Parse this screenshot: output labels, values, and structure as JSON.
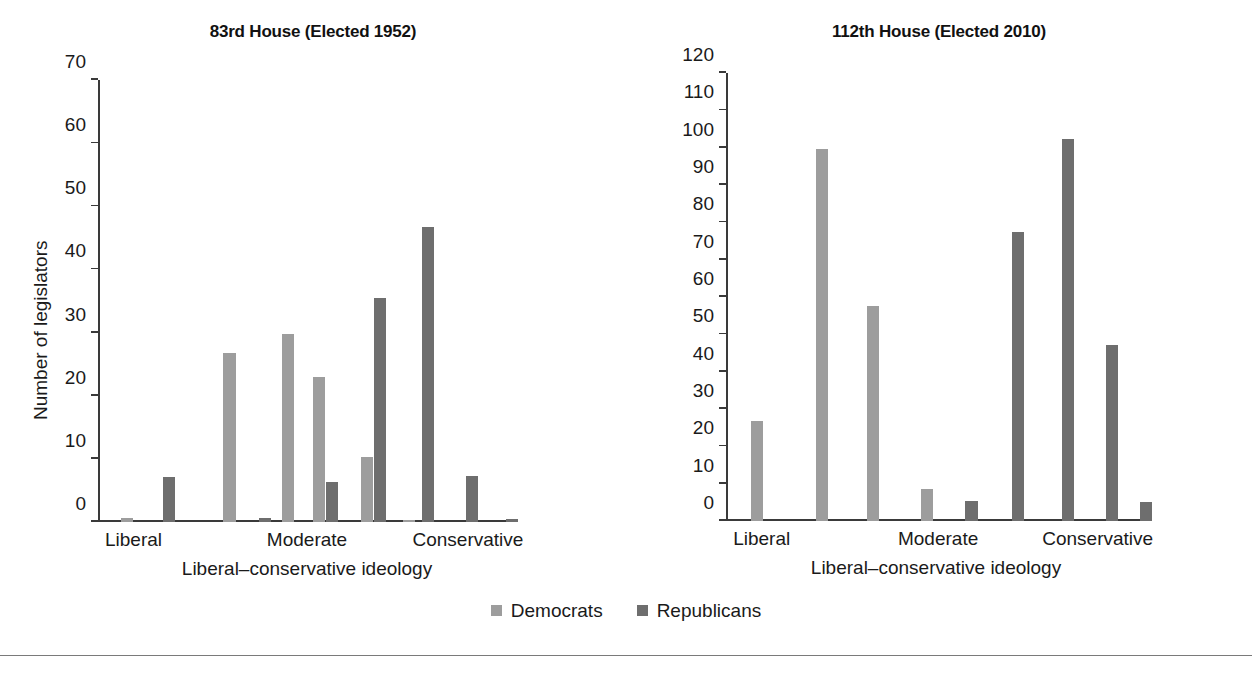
{
  "figure": {
    "legend": {
      "items": [
        {
          "label": "Democrats",
          "color": "#9d9d9d",
          "icon": "square-swatch-icon"
        },
        {
          "label": "Republicans",
          "color": "#6e6e6e",
          "icon": "square-swatch-icon"
        }
      ]
    },
    "colors": {
      "democrat": "#9d9d9d",
      "republican": "#6e6e6e",
      "axis": "#3a3a3a",
      "text": "#1a1a1a",
      "background": "#ffffff",
      "footer_rule": "#7a7a7a"
    }
  },
  "chart_data": [
    {
      "type": "bar",
      "id": "house-83rd",
      "title": "83rd House (Elected 1952)",
      "xlabel": "Liberal–conservative ideology",
      "ylabel": "Number of legislators",
      "ylim": [
        0,
        70
      ],
      "yticks": [
        0,
        10,
        20,
        30,
        40,
        50,
        60,
        70
      ],
      "grid": false,
      "legend_position": "bottom-center",
      "categories": [
        "Liberal",
        "Moderate",
        "Conservative"
      ],
      "category_positions": [
        0.085,
        0.5,
        0.885
      ],
      "bins": [
        {
          "position": 0.055,
          "series": "Democrats",
          "value": 0.7
        },
        {
          "position": 0.155,
          "series": "Republicans",
          "value": 7.2
        },
        {
          "position": 0.3,
          "series": "Democrats",
          "value": 26.8
        },
        {
          "position": 0.385,
          "series": "Republicans",
          "value": 0.6
        },
        {
          "position": 0.44,
          "series": "Democrats",
          "value": 29.8
        },
        {
          "position": 0.545,
          "series": "Republicans",
          "value": 6.4
        },
        {
          "position": 0.515,
          "series": "Democrats",
          "value": 23.0
        },
        {
          "position": 0.66,
          "series": "Republicans",
          "value": 35.5
        },
        {
          "position": 0.63,
          "series": "Democrats",
          "value": 10.3
        },
        {
          "position": 0.775,
          "series": "Republicans",
          "value": 46.8
        },
        {
          "position": 0.73,
          "series": "Democrats",
          "value": 0.2
        },
        {
          "position": 0.88,
          "series": "Republicans",
          "value": 7.3
        },
        {
          "position": 0.975,
          "series": "Republicans",
          "value": 0.4
        }
      ],
      "series": [
        {
          "name": "Democrats",
          "values": [
            0.7,
            26.8,
            29.8,
            23.0,
            10.3,
            0.2
          ]
        },
        {
          "name": "Republicans",
          "values": [
            7.2,
            0.6,
            6.4,
            35.5,
            46.8,
            7.3,
            0.4
          ]
        }
      ]
    },
    {
      "type": "bar",
      "id": "house-112th",
      "title": "112th House (Elected 2010)",
      "xlabel": "Liberal–conservative ideology",
      "ylabel": "Number of legislators",
      "ylim": [
        0,
        120
      ],
      "yticks": [
        0,
        10,
        20,
        30,
        40,
        50,
        60,
        70,
        80,
        90,
        100,
        110,
        120
      ],
      "grid": false,
      "legend_position": "bottom-center",
      "categories": [
        "Liberal",
        "Moderate",
        "Conservative"
      ],
      "category_positions": [
        0.085,
        0.505,
        0.885
      ],
      "bins": [
        {
          "position": 0.06,
          "series": "Democrats",
          "value": 26.8
        },
        {
          "position": 0.215,
          "series": "Democrats",
          "value": 99.7
        },
        {
          "position": 0.335,
          "series": "Democrats",
          "value": 57.5
        },
        {
          "position": 0.465,
          "series": "Democrats",
          "value": 8.5
        },
        {
          "position": 0.57,
          "series": "Republicans",
          "value": 5.4
        },
        {
          "position": 0.68,
          "series": "Republicans",
          "value": 77.3
        },
        {
          "position": 0.8,
          "series": "Republicans",
          "value": 102.3
        },
        {
          "position": 0.905,
          "series": "Republicans",
          "value": 47.2
        },
        {
          "position": 0.985,
          "series": "Republicans",
          "value": 5.0
        }
      ],
      "series": [
        {
          "name": "Democrats",
          "values": [
            26.8,
            99.7,
            57.5,
            8.5
          ]
        },
        {
          "name": "Republicans",
          "values": [
            5.4,
            77.3,
            102.3,
            47.2,
            5.0
          ]
        }
      ]
    }
  ]
}
